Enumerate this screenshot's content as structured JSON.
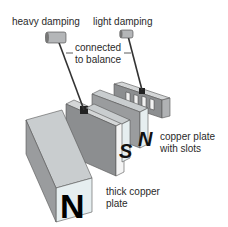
{
  "labels": {
    "heavy_damping": "heavy damping",
    "light_damping": "light damping",
    "connected_line1": "connected",
    "connected_line2": "to balance",
    "copper_slots_line1": "copper plate",
    "copper_slots_line2": "with slots",
    "thick_copper_line1": "thick copper",
    "thick_copper_line2": "plate"
  },
  "poles": {
    "front_magnet": "N",
    "middle_magnet": "S",
    "back_magnet": "N"
  },
  "colors": {
    "magnet_top": "#c9cdcf",
    "magnet_side": "#9a9c9e",
    "magnet_face": "#e6eef0",
    "plate_top": "#d4d6d7",
    "plate_side": "#8c8e90",
    "rod": "#333333",
    "text": "#2a2a2a"
  }
}
